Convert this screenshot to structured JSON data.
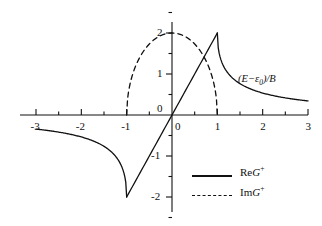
{
  "chart_data": {
    "type": "line",
    "title": "",
    "xlabel": "(E−ε₀)/B",
    "ylabel": "",
    "xlim": [
      -3,
      3
    ],
    "ylim": [
      -2.6,
      2.45
    ],
    "grid": false,
    "legend_position": "bottom-right",
    "xticks": [
      "-3",
      "-2",
      "-1",
      "0",
      "1",
      "2",
      "3"
    ],
    "xtick_values": [
      -3,
      -2,
      -1,
      0,
      1,
      2,
      3
    ],
    "xminor_step": 0.5,
    "yticks": [
      "2",
      "1",
      "0",
      "-1",
      "-2"
    ],
    "ytick_values": [
      2,
      1,
      0,
      -1,
      -2
    ],
    "yminor_step": 0.5,
    "series": [
      {
        "name": "ReG+",
        "style": "solid",
        "color": "#111111",
        "description": "Real part of retarded Green function: 2x inside band |x|<1, 2(x - sign(x)*sqrt(x^2-1)) outside",
        "x": [
          -3,
          -2.8,
          -2.6,
          -2.4,
          -2.2,
          -2,
          -1.8,
          -1.6,
          -1.4,
          -1.2,
          -1.1,
          -1.05,
          -1,
          -0.8,
          -0.6,
          -0.4,
          -0.2,
          0,
          0.2,
          0.4,
          0.6,
          0.8,
          1,
          1.05,
          1.1,
          1.2,
          1.4,
          1.6,
          1.8,
          2,
          2.2,
          2.4,
          2.6,
          2.8,
          3
        ],
        "y": [
          -0.343,
          -0.371,
          -0.403,
          -0.441,
          -0.486,
          -0.536,
          -0.605,
          -0.696,
          -0.82,
          -1.016,
          -1.183,
          -1.296,
          -2,
          -1.6,
          -1.2,
          -0.8,
          -0.4,
          0,
          0.4,
          0.8,
          1.2,
          1.6,
          2,
          1.296,
          1.183,
          1.016,
          0.82,
          0.696,
          0.605,
          0.536,
          0.486,
          0.441,
          0.403,
          0.371,
          0.343
        ]
      },
      {
        "name": "ImG+",
        "style": "dashed",
        "color": "#111111",
        "description": "Imaginary part: semi-ellipse 2*sqrt(1-x^2) on [-1,1], zero outside",
        "x": [
          -1,
          -0.95,
          -0.9,
          -0.8,
          -0.7,
          -0.6,
          -0.5,
          -0.4,
          -0.3,
          -0.2,
          -0.1,
          0,
          0.1,
          0.2,
          0.3,
          0.4,
          0.5,
          0.6,
          0.7,
          0.8,
          0.9,
          0.95,
          1
        ],
        "y": [
          0,
          0.624,
          0.872,
          1.2,
          1.428,
          1.6,
          1.732,
          1.833,
          1.908,
          1.96,
          1.99,
          2,
          1.99,
          1.96,
          1.908,
          1.833,
          1.732,
          1.6,
          1.428,
          1.2,
          0.872,
          0.624,
          0
        ]
      }
    ]
  },
  "axis": {
    "x_label_main": "(E",
    "x_label_minus": "−",
    "x_label_eps": "ε",
    "x_label_eps_sub": "0",
    "x_label_tail": ")/B",
    "origin_x_label": "0",
    "origin_y_label": "0"
  },
  "legend": {
    "items": [
      {
        "prefix": "Re",
        "symbol": "G",
        "sup": "+",
        "style": "solid"
      },
      {
        "prefix": "Im",
        "symbol": "G",
        "sup": "+",
        "style": "dashed"
      }
    ]
  },
  "xticks": [
    {
      "label": "-3",
      "value": -3
    },
    {
      "label": "-2",
      "value": -2
    },
    {
      "label": "-1",
      "value": -1
    },
    {
      "label": "0",
      "value": 0
    },
    {
      "label": "1",
      "value": 1
    },
    {
      "label": "2",
      "value": 2
    },
    {
      "label": "3",
      "value": 3
    }
  ],
  "yticks": [
    {
      "label": "2",
      "value": 2
    },
    {
      "label": "1",
      "value": 1
    },
    {
      "label": "0",
      "value": 0
    },
    {
      "label": "-1",
      "value": -1
    },
    {
      "label": "-2",
      "value": -2
    }
  ]
}
